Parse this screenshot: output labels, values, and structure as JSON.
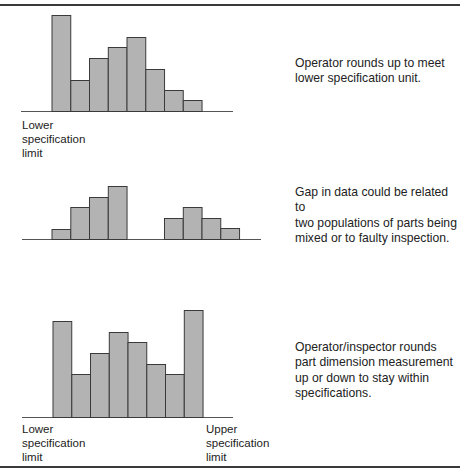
{
  "chart_data": [
    {
      "type": "bar",
      "title": "",
      "subtitle": "Histogram skewed at lower limit",
      "categories": [
        "1",
        "2",
        "3",
        "4",
        "5",
        "6",
        "7",
        "8"
      ],
      "values": [
        96,
        31,
        53,
        64,
        74,
        42,
        21,
        11
      ],
      "xlabel": "",
      "ylabel": "",
      "grid": false,
      "annotations": [
        "Lower specification limit"
      ],
      "note": "Operator rounds up to meet lower specification unit.",
      "layout": {
        "x0": 52,
        "bar_w": 18.75,
        "baseline": 111,
        "axis_from": 21,
        "axis_to": 233,
        "gaps": []
      }
    },
    {
      "type": "bar",
      "title": "",
      "subtitle": "Bimodal histogram with gap",
      "categories": [
        "1",
        "2",
        "3",
        "4",
        "5",
        "6",
        "7",
        "8",
        "9",
        "10"
      ],
      "values": [
        10,
        32,
        42,
        53,
        0,
        0,
        21,
        32,
        21,
        11
      ],
      "xlabel": "",
      "ylabel": "",
      "grid": false,
      "annotations": [],
      "note": "Gap in data could be related to two populations of parts being mixed or to faulty inspection.",
      "layout": {
        "x0": 52,
        "bar_w": 18.75,
        "baseline": 239,
        "axis_from": 22,
        "axis_to": 261
      }
    },
    {
      "type": "bar",
      "title": "",
      "subtitle": "Histogram with spikes at both limits",
      "categories": [
        "1",
        "2",
        "3",
        "4",
        "5",
        "6",
        "7",
        "8"
      ],
      "values": [
        96,
        43,
        64,
        85,
        75,
        53,
        43,
        107
      ],
      "xlabel": "",
      "ylabel": "",
      "grid": false,
      "annotations": [
        "Lower specification limit",
        "Upper specification limit"
      ],
      "note": "Operator/inspector rounds part dimension measurement up or down to stay within specifications.",
      "layout": {
        "x0": 53,
        "bar_w": 18.75,
        "baseline": 417,
        "axis_from": 22,
        "axis_to": 233
      }
    }
  ],
  "labels": {
    "chart1_lower": "Lower\nspecification\nlimit",
    "chart3_lower": "Lower\nspecification\nlimit",
    "chart3_upper": "Upper\nspecification\nlimit"
  },
  "notes": {
    "chart1": "Operator rounds up to meet\nlower specification unit.",
    "chart2": "Gap in data could be related to\ntwo populations of parts being\nmixed or to faulty inspection.",
    "chart3": "Operator/inspector rounds\npart dimension measurement\nup or down to stay within\nspecifications."
  },
  "colors": {
    "bar_fill": "#b3b3b3",
    "bar_stroke": "#3a3a3a",
    "rule": "#3a3a3a",
    "text": "#222222"
  }
}
